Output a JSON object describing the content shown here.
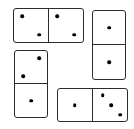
{
  "scene": {
    "title": "Domino tiles arrangement",
    "background_color": "#ffffff",
    "tile_face_color": "#ffffff",
    "tile_border_color": "#2b2b2b",
    "pip_color": "#000000",
    "tile_count": 4,
    "total_pips": 12
  },
  "dominoes": [
    {
      "id": "domino-top-left",
      "orientation": "horizontal",
      "value_label": "2-2",
      "left_pips": 2,
      "right_pips": 2,
      "left_pattern": "diagonal-tl-br",
      "right_pattern": "diagonal-tl-br",
      "x": 13,
      "y": 8,
      "width": 71,
      "height": 35
    },
    {
      "id": "domino-right",
      "orientation": "vertical",
      "value_label": "1-1",
      "top_pips": 1,
      "bottom_pips": 1,
      "top_pattern": "center",
      "bottom_pattern": "center",
      "x": 92,
      "y": 10,
      "width": 34,
      "height": 70
    },
    {
      "id": "domino-left",
      "orientation": "vertical",
      "value_label": "2-1",
      "top_pips": 2,
      "bottom_pips": 1,
      "top_pattern": "diagonal-tr-bl",
      "bottom_pattern": "center",
      "x": 14,
      "y": 50,
      "width": 34,
      "height": 68
    },
    {
      "id": "domino-bottom-right",
      "orientation": "horizontal",
      "value_label": "1-3",
      "left_pips": 1,
      "right_pips": 3,
      "left_pattern": "center",
      "right_pattern": "diagonal-tl-br-3",
      "x": 57,
      "y": 88,
      "width": 71,
      "height": 34
    }
  ]
}
